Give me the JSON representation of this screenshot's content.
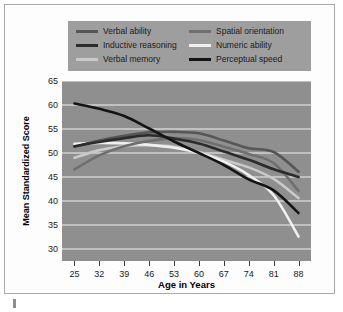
{
  "chart_data": {
    "type": "line",
    "title": "",
    "xlabel": "Age in Years",
    "ylabel": "Mean Standardized Score",
    "x": [
      25,
      32,
      39,
      46,
      53,
      60,
      67,
      74,
      81,
      88
    ],
    "xlim": [
      21.5,
      91.5
    ],
    "ylim": [
      27.5,
      65
    ],
    "yticks": [
      30,
      35,
      40,
      45,
      50,
      55,
      60,
      65
    ],
    "xticks": [
      25,
      32,
      39,
      46,
      53,
      60,
      67,
      74,
      81,
      88
    ],
    "grid": "horizontal",
    "legend_position": "top",
    "plot_background": "#8f8f8f",
    "gridline_color": "#f2f2f2",
    "series": [
      {
        "name": "Verbal ability",
        "color": "#565656",
        "values": [
          51.3,
          52.6,
          53.6,
          54.3,
          54.4,
          54.1,
          52.6,
          51.0,
          50.2,
          46.1
        ]
      },
      {
        "name": "Inductive reasoning",
        "color": "#2b2b2b",
        "values": [
          51.4,
          52.3,
          53.1,
          53.7,
          53.0,
          52.0,
          50.3,
          48.6,
          46.6,
          45.0
        ]
      },
      {
        "name": "Verbal memory",
        "color": "#c9c9c9",
        "values": [
          49.0,
          50.6,
          51.4,
          51.6,
          51.3,
          50.2,
          48.6,
          47.0,
          44.6,
          40.6
        ]
      },
      {
        "name": "Spatial orientation",
        "color": "#6f6f6f",
        "values": [
          46.6,
          49.5,
          51.4,
          52.5,
          53.1,
          52.7,
          51.3,
          49.8,
          47.9,
          42.1
        ]
      },
      {
        "name": "Numeric ability",
        "color": "#f0f0f0",
        "values": [
          51.9,
          52.1,
          52.0,
          51.7,
          51.1,
          50.0,
          48.2,
          45.4,
          41.2,
          32.6
        ]
      },
      {
        "name": "Perceptual speed",
        "color": "#141414",
        "values": [
          60.3,
          59.2,
          57.7,
          55.1,
          52.4,
          50.0,
          47.5,
          44.5,
          42.2,
          37.5
        ]
      }
    ]
  }
}
